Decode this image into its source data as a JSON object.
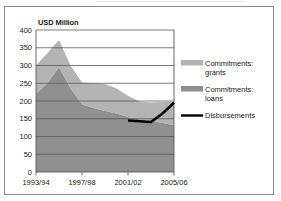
{
  "figure": {
    "axis_title": "USD Million",
    "border_color": "#8a8a8a",
    "background": "#ffffff"
  },
  "colors": {
    "grants": "#b3b3b3",
    "loans": "#8f8f8f",
    "disbursements": "#000000",
    "gridline": "#595959",
    "axis": "#595959",
    "text": "#1a1a1a"
  },
  "legend": {
    "position": "right",
    "items": [
      {
        "label_line1": "Commitments:",
        "label_line2": "grants",
        "marker": "area-swatch",
        "color": "#b3b3b3"
      },
      {
        "label_line1": "Commitments:",
        "label_line2": "loans",
        "marker": "area-swatch",
        "color": "#8f8f8f"
      },
      {
        "label_line1": "Disbursements",
        "label_line2": "",
        "marker": "line-swatch",
        "color": "#000000"
      }
    ]
  },
  "chart_data": {
    "type": "area",
    "title": "USD Million",
    "xlabel": "",
    "ylabel": "USD Million",
    "ylim": [
      0,
      400
    ],
    "yticks": [
      0,
      50,
      100,
      150,
      200,
      250,
      300,
      350,
      400
    ],
    "grid": true,
    "stacked": true,
    "x": [
      "1993/94",
      "1994/95",
      "1995/96",
      "1996/97",
      "1997/98",
      "1998/99",
      "1999/00",
      "2000/01",
      "2001/02",
      "2002/03",
      "2003/04",
      "2004/05",
      "2005/06"
    ],
    "xticklabels": [
      "1993/94",
      "1997/98",
      "2001/02",
      "2005/06"
    ],
    "xtick_indices": [
      0,
      4,
      8,
      12
    ],
    "series": [
      {
        "name": "Commitments: loans",
        "type": "area",
        "color": "#8f8f8f",
        "values": [
          220,
          250,
          295,
          235,
          190,
          180,
          172,
          165,
          155,
          148,
          143,
          138,
          132
        ]
      },
      {
        "name": "Commitments: grants",
        "type": "area",
        "color": "#b3b3b3",
        "stacked_top": [
          300,
          335,
          372,
          300,
          252,
          250,
          248,
          235,
          215,
          198,
          196,
          197,
          198
        ],
        "values": [
          80,
          85,
          77,
          65,
          62,
          70,
          76,
          70,
          60,
          50,
          53,
          59,
          66
        ]
      },
      {
        "name": "Disbursements",
        "type": "line",
        "color": "#000000",
        "x": [
          "2001/02",
          "2002/03",
          "2003/04",
          "2004/05",
          "2005/06"
        ],
        "values": [
          145,
          143,
          141,
          165,
          195
        ]
      }
    ]
  }
}
